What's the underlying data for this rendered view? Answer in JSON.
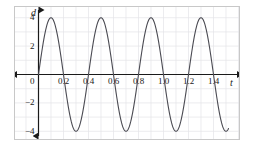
{
  "chart_data": {
    "type": "line",
    "title": "",
    "subtitle": "",
    "xlabel": "t",
    "ylabel": "d",
    "xlim": [
      -0.06,
      1.56
    ],
    "ylim": [
      -5.2,
      5.2
    ],
    "grid": true,
    "grid_x_step": 0.1,
    "grid_y_step": 1,
    "legend": "none",
    "xticks": [
      0,
      0.2,
      0.4,
      0.6,
      0.8,
      1.0,
      1.2,
      1.4
    ],
    "xticklabels": [
      "0",
      "0.2",
      "0.4",
      "0.6",
      "0.8",
      "1.0",
      "1.2",
      "1.4"
    ],
    "yticks": [
      4,
      2,
      -2,
      -4
    ],
    "yticklabels": [
      "4",
      "2",
      "−2",
      "−4"
    ],
    "curve": {
      "name": "d(t)",
      "function": "d = 4 sin(2πt / 0.4)",
      "amplitude": 4,
      "period": 0.4,
      "frequency": 2.5,
      "phase": 0,
      "midline": 0,
      "color": "#4a4a52",
      "linewidth": 1.1,
      "t_start": 0,
      "t_end": 1.52,
      "peaks_t": [
        0.1,
        0.5,
        0.9,
        1.3
      ],
      "peaks_d": [
        4,
        4,
        4,
        4
      ],
      "troughs_t": [
        0.3,
        0.7,
        1.1,
        1.5
      ],
      "troughs_d": [
        -4,
        -4,
        -4,
        -4
      ],
      "zero_crossings_t": [
        0,
        0.2,
        0.4,
        0.6,
        0.8,
        1.0,
        1.2,
        1.4
      ]
    },
    "axes_style": {
      "axis_color": "#1a1a1a",
      "grid_color": "#e2e2e6",
      "frame_color": "#c8c8c8",
      "arrows": "both-ends-both-axes"
    }
  },
  "labels": {
    "origin": "0",
    "y_axis_name": "d",
    "x_axis_name": "t"
  }
}
